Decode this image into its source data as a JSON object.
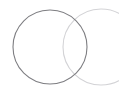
{
  "canvas": {
    "width": 119,
    "height": 94,
    "background_color": "#ffffff",
    "name": "two-overlapping-circles-figure"
  },
  "chart_data": {
    "type": "scatter",
    "title": "",
    "subtitle": "",
    "xlabel": "",
    "ylabel": "",
    "grid": false,
    "legend_position": "none",
    "tick_labels": [],
    "annotations": [],
    "xlim": [
      0,
      119
    ],
    "ylim": [
      0,
      94
    ],
    "series": [
      {
        "name": "left-circle",
        "shape": "circle",
        "center_x": 50,
        "center_y": 47,
        "radius": 37,
        "stroke_color": "#7e7e82",
        "stroke_width": 1.1,
        "fill": "none",
        "clipped": false
      },
      {
        "name": "right-circle",
        "shape": "circle",
        "center_x": 101,
        "center_y": 47,
        "radius": 38,
        "stroke_color": "#d3d3d6",
        "stroke_width": 1.1,
        "fill": "none",
        "clipped": true
      }
    ],
    "intersections": [
      {
        "name": "upper-intersection",
        "x": 78,
        "y": 13
      },
      {
        "name": "lower-intersection",
        "x": 74,
        "y": 79
      }
    ]
  },
  "colors": {
    "background": "#ffffff",
    "primary_stroke": "#7e7e82",
    "secondary_stroke": "#d3d3d6"
  }
}
